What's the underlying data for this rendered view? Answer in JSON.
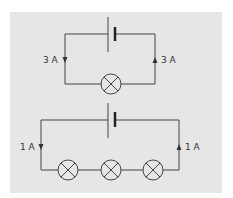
{
  "figure": {
    "background_color": "#e6e6e6",
    "wire_color": "#444444",
    "circuits": [
      {
        "name": "single-lamp-circuit",
        "lamp_count": 1,
        "current_left": {
          "label": "3 A",
          "direction": "down"
        },
        "current_right": {
          "label": "3 A",
          "direction": "up"
        }
      },
      {
        "name": "three-lamp-series-circuit",
        "lamp_count": 3,
        "current_left": {
          "label": "1 A",
          "direction": "down"
        },
        "current_right": {
          "label": "1 A",
          "direction": "up"
        }
      }
    ]
  }
}
